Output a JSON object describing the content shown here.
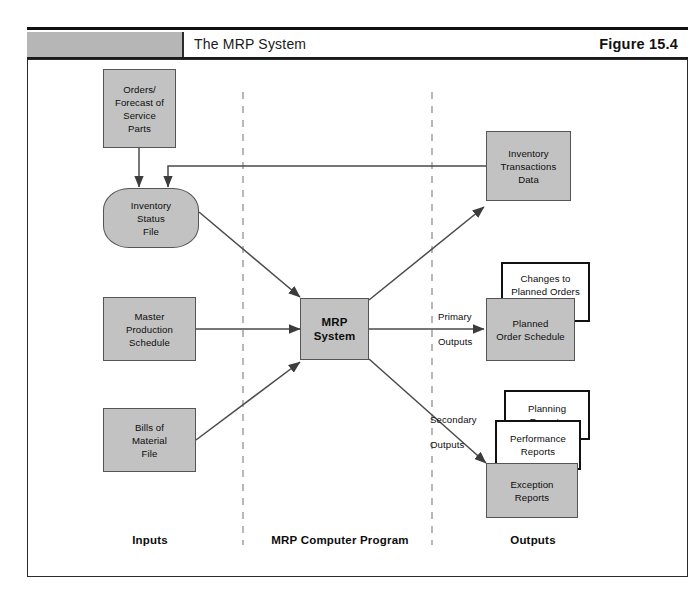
{
  "figure": {
    "tag": "Figure 15.4",
    "title": "The MRP System"
  },
  "colors": {
    "node_fill_gray": "#c2c2c2",
    "node_stroke": "#555555",
    "white_node_stroke": "#111111",
    "header_bar_gray": "#b6b6b6",
    "rule": "#111111",
    "connector": "#4a4a4a",
    "divider_dash": "#9a9a9a"
  },
  "inputs": {
    "orders_forecast": "Orders/\nForecast of\nService\nParts",
    "inventory_status_file": "Inventory\nStatus\nFile",
    "master_production_schedule": "Master\nProduction\nSchedule",
    "bills_of_material_file": "Bills of\nMaterial\nFile"
  },
  "program": {
    "mrp_system": "MRP\nSystem"
  },
  "outputs": {
    "inventory_transactions_data": "Inventory\nTransactions\nData",
    "changes_to_planned_orders": "Changes to\nPlanned Orders",
    "planned_order_schedule": "Planned\nOrder Schedule",
    "planning_reports": "Planning\nReports",
    "performance_reports": "Performance\nReports",
    "exception_reports": "Exception\nReports"
  },
  "flow_labels": {
    "primary": "Primary",
    "primary_outputs": "Outputs",
    "secondary": "Secondary",
    "secondary_outputs": "Outputs"
  },
  "categories": {
    "inputs": "Inputs",
    "program": "MRP Computer Program",
    "outputs": "Outputs"
  }
}
